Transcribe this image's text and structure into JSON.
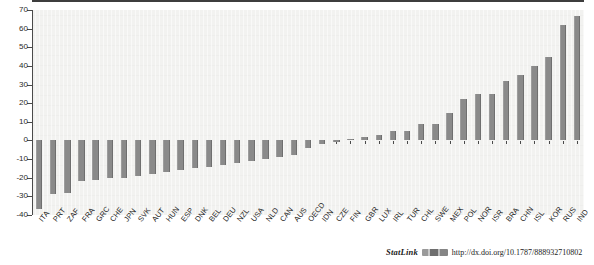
{
  "chart": {
    "type": "bar",
    "background_color": "#f2f2f0",
    "bar_color": "#8a8a8a",
    "axis_color": "#4a4a4a"
  },
  "footer": {
    "statlink_label": "StatLink",
    "logo_name": "statlink-barcode-logo",
    "url": "http://dx.doi.org/10.1787/888932710802"
  },
  "chart_data": {
    "type": "bar",
    "title": "",
    "subtitle": "",
    "xlabel": "",
    "ylabel": "",
    "ylim": [
      -40,
      70
    ],
    "yticks": [
      70,
      60,
      50,
      40,
      30,
      20,
      10,
      0,
      -10,
      -20,
      -30,
      -40
    ],
    "ytick_labels": [
      "70",
      "60",
      "50",
      "40",
      "30",
      "20",
      "10",
      "0",
      "-10",
      "-20",
      "-30",
      "-40"
    ],
    "grid": false,
    "legend": "none",
    "categories": [
      "ITA",
      "PRT",
      "ZAF",
      "FRA",
      "GRC",
      "CHE",
      "JPN",
      "SVK",
      "AUT",
      "HUN",
      "ESP",
      "DNK",
      "BEL",
      "DEU",
      "NZL",
      "USA",
      "NLD",
      "CAN",
      "AUS",
      "OECD",
      "IDN",
      "CZE",
      "FIN",
      "GBR",
      "LUX",
      "IRL",
      "TUR",
      "CHL",
      "SWE",
      "MEX",
      "POL",
      "NOR",
      "ISR",
      "BRA",
      "CHN",
      "ISL",
      "KOR",
      "RUS",
      "IND"
    ],
    "values": [
      -37,
      -29,
      -28,
      -22,
      -21,
      -20,
      -20,
      -19,
      -18,
      -17,
      -16,
      -15,
      -14,
      -13,
      -12,
      -11,
      -10,
      -9,
      -8,
      -4,
      -2,
      -1,
      1,
      2,
      3,
      5,
      5,
      9,
      9,
      15,
      22,
      25,
      25,
      32,
      35,
      40,
      45,
      62,
      67
    ]
  }
}
